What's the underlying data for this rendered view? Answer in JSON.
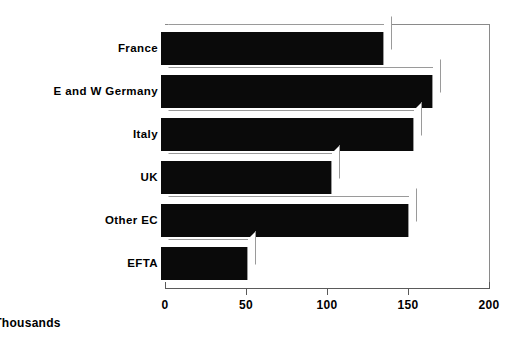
{
  "chart_data": {
    "type": "bar",
    "orientation": "horizontal",
    "title": "",
    "subtitle": "",
    "xlabel": "Thousands",
    "ylabel": "",
    "categories": [
      "France",
      "E and W Germany",
      "Italy",
      "UK",
      "Other EC",
      "EFTA"
    ],
    "values": [
      135,
      165,
      153,
      103,
      150,
      51
    ],
    "series": [
      {
        "name": "",
        "values": [
          135,
          165,
          153,
          103,
          150,
          51
        ]
      }
    ],
    "xlim": [
      0,
      200
    ],
    "ylim": null,
    "xticks": [
      0,
      50,
      100,
      150,
      200
    ],
    "xtick_labels": [
      "0",
      "50",
      "100",
      "150",
      "200"
    ],
    "grid": false,
    "legend": null,
    "legend_position": "none",
    "bar_color": "#0a0a0a",
    "style": "3d-shadow",
    "annotations": []
  },
  "axis": {
    "x_title": "Thousands",
    "tick_labels": [
      "0",
      "50",
      "100",
      "150",
      "200"
    ]
  },
  "categories": [
    {
      "label": "France",
      "value": 135
    },
    {
      "label": "E and W Germany",
      "value": 165
    },
    {
      "label": "Italy",
      "value": 153
    },
    {
      "label": "UK",
      "value": 103
    },
    {
      "label": "Other EC",
      "value": 150
    },
    {
      "label": "EFTA",
      "value": 51
    }
  ],
  "colors": {
    "bar": "#0a0a0a",
    "frame": "#8a8a8a",
    "axis": "#5a5a5a",
    "background": "#ffffff",
    "text": "#000000"
  }
}
